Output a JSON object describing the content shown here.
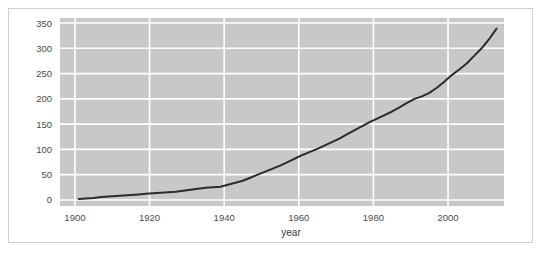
{
  "chart_data": {
    "type": "line",
    "title": "",
    "subtitle": "",
    "xlabel": "year",
    "ylabel": "",
    "xlim": [
      1896,
      2015
    ],
    "ylim": [
      -12,
      360
    ],
    "grid": true,
    "legend": null,
    "xticks": [
      1900,
      1920,
      1940,
      1960,
      1980,
      2000
    ],
    "xtick_labels": [
      "1900",
      "1920",
      "1940",
      "1960",
      "1980",
      "2000"
    ],
    "yticks": [
      0,
      50,
      100,
      150,
      200,
      250,
      300,
      350
    ],
    "ytick_labels": [
      "0",
      "50",
      "100",
      "150",
      "200",
      "250",
      "300",
      "350"
    ],
    "series": [
      {
        "name": "value",
        "color": "#2b2b2b",
        "linewidth": 2,
        "x": [
          1901,
          1903,
          1905,
          1907,
          1909,
          1911,
          1913,
          1915,
          1917,
          1919,
          1921,
          1923,
          1925,
          1927,
          1929,
          1931,
          1933,
          1935,
          1937,
          1939,
          1941,
          1943,
          1945,
          1947,
          1949,
          1951,
          1953,
          1955,
          1957,
          1959,
          1961,
          1963,
          1965,
          1967,
          1969,
          1971,
          1973,
          1975,
          1977,
          1979,
          1981,
          1983,
          1985,
          1987,
          1989,
          1991,
          1993,
          1995,
          1997,
          1999,
          2001,
          2003,
          2005,
          2007,
          2009,
          2011,
          2013
        ],
        "y": [
          2,
          3,
          4,
          6,
          7,
          8,
          9,
          10,
          11,
          12,
          13,
          14,
          15,
          16,
          18,
          20,
          22,
          24,
          25,
          26,
          30,
          34,
          38,
          44,
          50,
          56,
          62,
          68,
          75,
          82,
          89,
          95,
          101,
          108,
          115,
          122,
          130,
          138,
          146,
          154,
          161,
          168,
          175,
          183,
          192,
          200,
          205,
          212,
          222,
          234,
          247,
          258,
          270,
          285,
          300,
          318,
          339
        ]
      }
    ],
    "colors": {
      "plot_background": "#c8c8c8",
      "grid_line": "#ffffff",
      "line": "#2b2b2b",
      "figure_background": "#ffffff",
      "figure_border": "#cfcfcf",
      "tick_text": "#4a4a4a"
    }
  }
}
